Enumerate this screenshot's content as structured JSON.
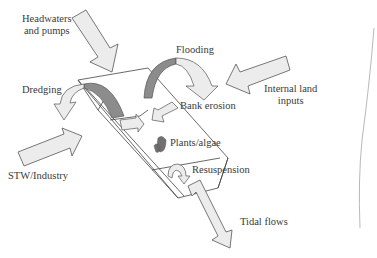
{
  "diagram": {
    "labels": {
      "headwaters": [
        "Headwaters",
        "and pumps"
      ],
      "flooding": "Flooding",
      "internal_land": [
        "Internal land",
        "inputs"
      ],
      "dredging": "Dredging",
      "bank_erosion": "Bank erosion",
      "plants_algae": "Plants/algae",
      "stw_industry": "STW/Industry",
      "resuspension": "Resuspension",
      "tidal_flows": "Tidal flows"
    },
    "colors": {
      "arrow_fill": "#ececec",
      "arrow_stroke": "#555555",
      "dark_fill": "#8c8c8c",
      "line": "#444444"
    }
  }
}
